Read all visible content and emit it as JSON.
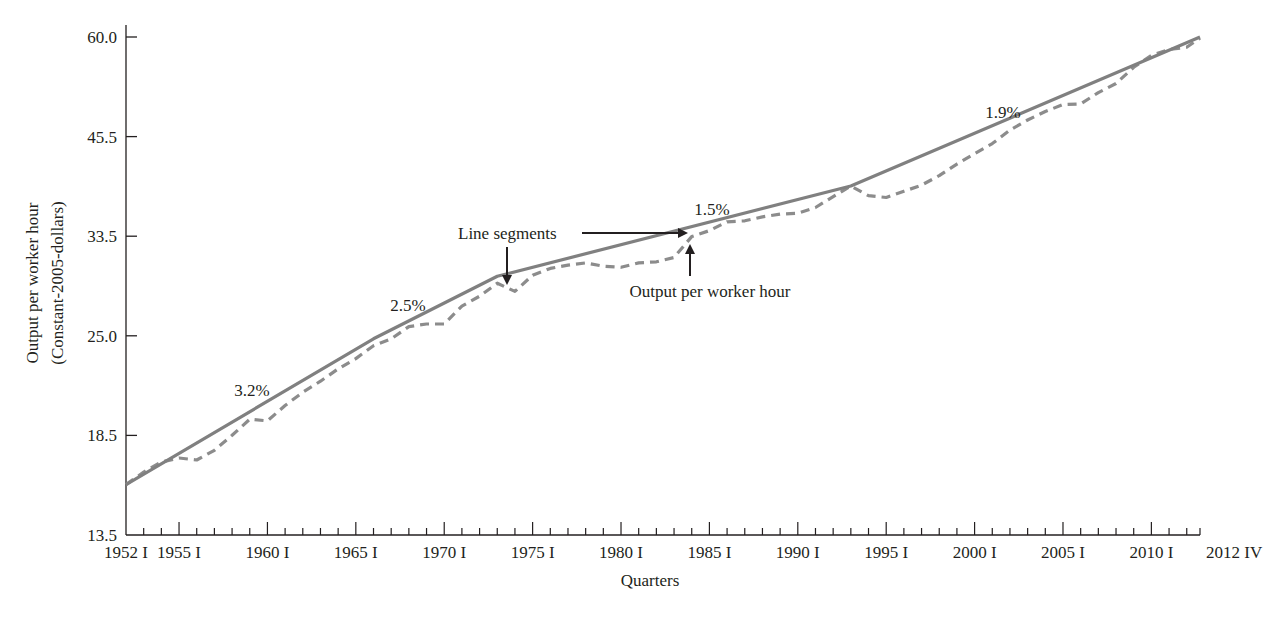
{
  "chart_data": {
    "type": "line",
    "title": "",
    "xlabel": "Quarters",
    "ylabel": "Output per worker hour",
    "ylabel_sub": "(Constant-2005-dollars)",
    "y_scale": "log",
    "ylim": [
      13.5,
      60.0
    ],
    "y_ticks": [
      "60.0",
      "45.5",
      "33.5",
      "25.0",
      "18.5",
      "13.5"
    ],
    "x_tick_labels": [
      "1952 I",
      "1955 I",
      "1960 I",
      "1965 I",
      "1970 I",
      "1975 I",
      "1980 I",
      "1985 I",
      "1990 I",
      "1995 I",
      "2000 I",
      "2005 I",
      "2010 I",
      "2012 IV"
    ],
    "grid": false,
    "legend": "none (inline annotations)",
    "series": [
      {
        "name": "Line segments",
        "style": "solid",
        "color": "#808080",
        "x": [
          1952.0,
          1966.0,
          1973.0,
          1993.0,
          2012.75
        ],
        "values": [
          15.7,
          24.3,
          29.3,
          38.4,
          60.0
        ]
      },
      {
        "name": "Output per worker hour",
        "style": "dashed",
        "color": "#8c8c8c",
        "x": [
          1952.0,
          1953.0,
          1954.0,
          1955.0,
          1956.0,
          1957.0,
          1958.0,
          1959.0,
          1960.0,
          1961.0,
          1962.0,
          1963.0,
          1964.0,
          1965.0,
          1966.0,
          1967.0,
          1968.0,
          1969.0,
          1970.0,
          1971.0,
          1972.0,
          1973.0,
          1974.0,
          1975.0,
          1976.0,
          1977.0,
          1978.0,
          1979.0,
          1980.0,
          1981.0,
          1982.0,
          1983.0,
          1984.0,
          1985.0,
          1986.0,
          1987.0,
          1988.0,
          1989.0,
          1990.0,
          1991.0,
          1992.0,
          1993.0,
          1994.0,
          1995.0,
          1996.0,
          1997.0,
          1998.0,
          1999.0,
          2000.0,
          2001.0,
          2002.0,
          2003.0,
          2004.0,
          2005.0,
          2006.0,
          2007.0,
          2008.0,
          2009.0,
          2010.0,
          2011.0,
          2012.0,
          2012.75
        ],
        "values": [
          15.7,
          16.3,
          16.8,
          17.0,
          16.9,
          17.4,
          18.2,
          19.1,
          19.0,
          19.9,
          20.7,
          21.4,
          22.2,
          22.9,
          23.8,
          24.3,
          25.2,
          25.4,
          25.4,
          26.8,
          27.6,
          28.7,
          28.0,
          29.4,
          30.0,
          30.3,
          30.5,
          30.2,
          30.1,
          30.5,
          30.6,
          31.0,
          33.0,
          33.6,
          34.5,
          34.6,
          35.0,
          35.3,
          35.4,
          36.0,
          37.2,
          38.4,
          37.3,
          37.1,
          37.8,
          38.5,
          39.6,
          41.0,
          42.3,
          43.6,
          45.4,
          46.8,
          48.0,
          49.0,
          49.1,
          50.8,
          52.2,
          54.8,
          56.8,
          57.8,
          58.2,
          59.8
        ]
      }
    ],
    "annotations": [
      {
        "text": "3.2%",
        "period": "1952-1966"
      },
      {
        "text": "2.5%",
        "period": "1966-1973"
      },
      {
        "text": "1.5%",
        "period": "1973-1993"
      },
      {
        "text": "1.9%",
        "period": "1993-2012"
      },
      {
        "text": "Line segments",
        "arrow": "to solid line"
      },
      {
        "text": "Output per worker hour",
        "arrow": "to dashed line"
      }
    ]
  },
  "labels": {
    "ylabel_line1": "Output per worker hour",
    "ylabel_line2": "(Constant-2005-dollars)",
    "xlabel": "Quarters",
    "rate_1": "3.2%",
    "rate_2": "2.5%",
    "rate_3": "1.5%",
    "rate_4": "1.9%",
    "annot_segments": "Line segments",
    "annot_output": "Output per worker hour"
  },
  "colors": {
    "axis": "#231f20",
    "line": "#808080",
    "dashed": "#8c8c8c"
  }
}
